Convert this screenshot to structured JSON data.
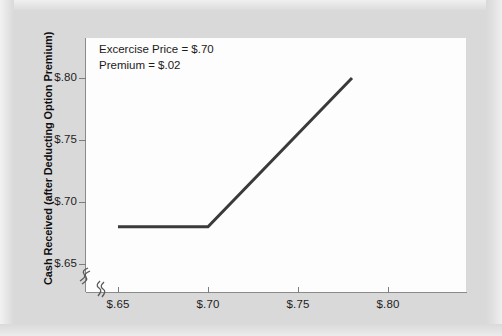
{
  "figure": {
    "background_color": "#d9d9d9",
    "plot_background_color": "#fdfdfd",
    "axis_color": "#8a8a8a"
  },
  "annotation": {
    "line1": "Excercise Price = $.70",
    "line2": "Premium = $.02"
  },
  "axis_titles": {
    "y": "Cash Received (after Deducting Option Premium)",
    "x": ""
  },
  "y_ticks": [
    {
      "label": "$.80",
      "value": 0.8,
      "pixel_y": 78
    },
    {
      "label": "$.75",
      "value": 0.75,
      "pixel_y": 140
    },
    {
      "label": "$.70",
      "value": 0.7,
      "pixel_y": 202
    },
    {
      "label": "$.65",
      "value": 0.65,
      "pixel_y": 264
    }
  ],
  "x_ticks": [
    {
      "label": "$.65",
      "value": 0.65,
      "pixel_x": 118
    },
    {
      "label": "$.70",
      "value": 0.7,
      "pixel_x": 208
    },
    {
      "label": "$.75",
      "value": 0.75,
      "pixel_x": 298
    },
    {
      "label": "$.80",
      "value": 0.8,
      "pixel_x": 388
    }
  ],
  "axis_breaks": {
    "y_break_symbol": "axis-break-icon",
    "x_break_symbol": "axis-break-icon"
  },
  "chart_data": {
    "type": "line",
    "title": "",
    "subtitle": "",
    "xlabel": "",
    "ylabel": "Cash Received (after Deducting Option Premium)",
    "xlim": [
      0.6389,
      0.85
    ],
    "ylim": [
      0.6295,
      0.8097
    ],
    "xtick_labels": [
      "$.65",
      "$.70",
      "$.75",
      "$.80"
    ],
    "xtick_values": [
      0.65,
      0.7,
      0.75,
      0.8
    ],
    "ytick_labels": [
      "$.65",
      "$.70",
      "$.75",
      "$.80"
    ],
    "ytick_values": [
      0.65,
      0.7,
      0.75,
      0.8
    ],
    "grid": false,
    "legend": null,
    "axis_break_x": true,
    "axis_break_y": true,
    "series": [
      {
        "name": "Cash received net of option premium",
        "color": "#3a3a3a",
        "line_width_px": 3,
        "x": [
          0.65,
          0.7,
          0.78
        ],
        "y": [
          0.68,
          0.68,
          0.8
        ],
        "points": [
          {
            "x": 0.65,
            "y": 0.68
          },
          {
            "x": 0.7,
            "y": 0.68
          },
          {
            "x": 0.78,
            "y": 0.8
          }
        ]
      }
    ],
    "annotations": [
      {
        "text": "Excercise Price = $.70",
        "x": 0.655,
        "y": 0.8045
      },
      {
        "text": "Premium = $.02",
        "x": 0.655,
        "y": 0.7935
      }
    ]
  }
}
